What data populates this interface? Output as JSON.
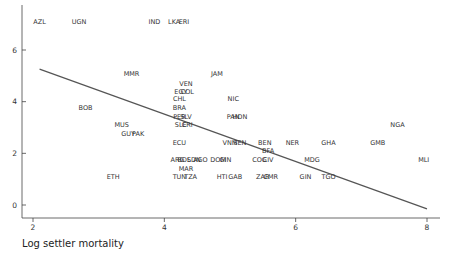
{
  "chart_data": {
    "type": "scatter",
    "title": "",
    "xlabel": "Log settler mortality",
    "ylabel": "",
    "xlim": [
      1.9,
      8.1
    ],
    "ylim": [
      -0.5,
      7.5
    ],
    "xticks": [
      2,
      4,
      6,
      8
    ],
    "yticks": [
      0,
      2,
      4,
      6
    ],
    "grid": false,
    "legend": "none",
    "points": [
      {
        "label": "AZL",
        "x": 2.1,
        "y": 7.1
      },
      {
        "label": "UGN",
        "x": 2.7,
        "y": 7.1
      },
      {
        "label": "IND",
        "x": 3.85,
        "y": 7.1
      },
      {
        "label": "LKA",
        "x": 4.15,
        "y": 7.1
      },
      {
        "label": "ERI",
        "x": 4.3,
        "y": 7.1
      },
      {
        "label": "MMR",
        "x": 3.5,
        "y": 5.1
      },
      {
        "label": "JAM",
        "x": 4.8,
        "y": 5.1
      },
      {
        "label": "VEN",
        "x": 4.33,
        "y": 4.7
      },
      {
        "label": "EGY",
        "x": 4.25,
        "y": 4.4
      },
      {
        "label": "COL",
        "x": 4.35,
        "y": 4.4
      },
      {
        "label": "CHL",
        "x": 4.23,
        "y": 4.1
      },
      {
        "label": "NIC",
        "x": 5.05,
        "y": 4.1
      },
      {
        "label": "BRA",
        "x": 4.23,
        "y": 3.75
      },
      {
        "label": "BOB",
        "x": 2.8,
        "y": 3.75
      },
      {
        "label": "PER",
        "x": 4.23,
        "y": 3.4
      },
      {
        "label": "SLV",
        "x": 4.33,
        "y": 3.4
      },
      {
        "label": "PAN",
        "x": 5.05,
        "y": 3.4
      },
      {
        "label": "HON",
        "x": 5.15,
        "y": 3.4
      },
      {
        "label": "SLE",
        "x": 4.25,
        "y": 3.1
      },
      {
        "label": "CRI",
        "x": 4.35,
        "y": 3.1
      },
      {
        "label": "MUS",
        "x": 3.35,
        "y": 3.1
      },
      {
        "label": "GUY",
        "x": 3.45,
        "y": 2.75
      },
      {
        "label": "PAK",
        "x": 3.6,
        "y": 2.75
      },
      {
        "label": "NGA",
        "x": 7.55,
        "y": 3.1
      },
      {
        "label": "ECU",
        "x": 4.23,
        "y": 2.4
      },
      {
        "label": "VNM",
        "x": 5.0,
        "y": 2.4
      },
      {
        "label": "SEN",
        "x": 5.15,
        "y": 2.4
      },
      {
        "label": "BEN",
        "x": 5.53,
        "y": 2.4
      },
      {
        "label": "NER",
        "x": 5.95,
        "y": 2.4
      },
      {
        "label": "GHA",
        "x": 6.5,
        "y": 2.4
      },
      {
        "label": "GMB",
        "x": 7.25,
        "y": 2.4
      },
      {
        "label": "BFA",
        "x": 5.58,
        "y": 2.1
      },
      {
        "label": "ARG",
        "x": 4.2,
        "y": 1.75
      },
      {
        "label": "BOL",
        "x": 4.3,
        "y": 1.75
      },
      {
        "label": "SDN",
        "x": 4.45,
        "y": 1.75
      },
      {
        "label": "AGO",
        "x": 4.55,
        "y": 1.75
      },
      {
        "label": "DOM",
        "x": 4.82,
        "y": 1.75
      },
      {
        "label": "GIN",
        "x": 4.93,
        "y": 1.75
      },
      {
        "label": "COG",
        "x": 5.45,
        "y": 1.75
      },
      {
        "label": "CIV",
        "x": 5.58,
        "y": 1.75
      },
      {
        "label": "MDG",
        "x": 6.25,
        "y": 1.75
      },
      {
        "label": "MLI",
        "x": 7.95,
        "y": 1.75
      },
      {
        "label": "MAR",
        "x": 4.33,
        "y": 1.4
      },
      {
        "label": "ETH",
        "x": 3.22,
        "y": 1.1
      },
      {
        "label": "TUN",
        "x": 4.23,
        "y": 1.1
      },
      {
        "label": "TZA",
        "x": 4.4,
        "y": 1.1
      },
      {
        "label": "HTI",
        "x": 4.88,
        "y": 1.1
      },
      {
        "label": "GAB",
        "x": 5.08,
        "y": 1.1
      },
      {
        "label": "ZAR",
        "x": 5.5,
        "y": 1.1
      },
      {
        "label": "CMR",
        "x": 5.62,
        "y": 1.1
      },
      {
        "label": "GIN",
        "x": 6.15,
        "y": 1.1
      },
      {
        "label": "TGO",
        "x": 6.5,
        "y": 1.1
      }
    ],
    "fit_line": {
      "x": [
        2.1,
        8.0
      ],
      "y": [
        5.26,
        -0.15
      ]
    }
  }
}
